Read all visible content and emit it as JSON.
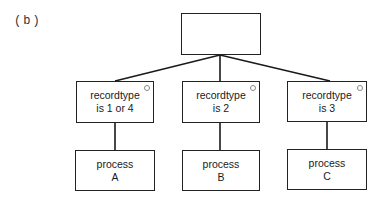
{
  "figure_label": "(b)",
  "root": {
    "text": ""
  },
  "branches": [
    {
      "condition_line1": "recordtype",
      "condition_line2": "is 1 or 4",
      "process_line1": "process",
      "process_line2": "A"
    },
    {
      "condition_line1": "recordtype",
      "condition_line2": "is 2",
      "process_line1": "process",
      "process_line2": "B"
    },
    {
      "condition_line1": "recordtype",
      "condition_line2": "is 3",
      "process_line1": "process",
      "process_line2": "C"
    }
  ],
  "colors": {
    "line": "#1a1a1a",
    "box_border": "#222222",
    "background": "#ffffff"
  }
}
